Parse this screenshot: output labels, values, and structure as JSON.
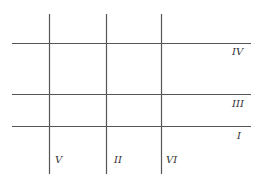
{
  "diagram": {
    "line_color": "#555555",
    "background": "#ffffff",
    "vertical_lines": [
      {
        "id": "V",
        "label": "V",
        "x": 49,
        "y1": 14,
        "y2": 174,
        "label_x": 55,
        "label_y": 155
      },
      {
        "id": "II",
        "label": "II",
        "x": 106,
        "y1": 14,
        "y2": 174,
        "label_x": 114,
        "label_y": 155
      },
      {
        "id": "VI",
        "label": "VI",
        "x": 161,
        "y1": 14,
        "y2": 174,
        "label_x": 166,
        "label_y": 155
      }
    ],
    "horizontal_lines": [
      {
        "id": "IV",
        "label": "IV",
        "y": 43,
        "x1": 12,
        "x2": 251,
        "label_x": 232,
        "label_y": 47
      },
      {
        "id": "III",
        "label": "III",
        "y": 94,
        "x1": 12,
        "x2": 251,
        "label_x": 232,
        "label_y": 99
      },
      {
        "id": "I",
        "label": "I",
        "y": 126,
        "x1": 12,
        "x2": 251,
        "label_x": 237,
        "label_y": 131
      }
    ]
  }
}
